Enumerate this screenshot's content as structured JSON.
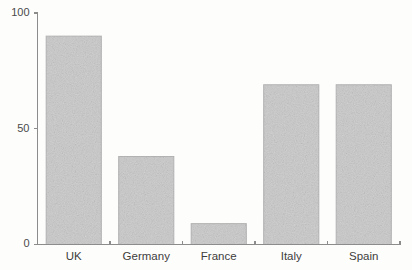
{
  "chart_data": {
    "type": "bar",
    "title": "",
    "subtitle": "",
    "xlabel": "",
    "ylabel": "",
    "categories": [
      "UK",
      "Germany",
      "France",
      "Italy",
      "Spain"
    ],
    "values": [
      90,
      38,
      9,
      69,
      69
    ],
    "ylim": [
      0,
      100
    ],
    "yticks": [
      0,
      50,
      100
    ],
    "ytick_labels": [
      "0",
      "50",
      "100"
    ],
    "grid": false,
    "legend": false,
    "legend_position": "none",
    "bar_color": "#c9c9c9",
    "bar_edge_color": "#b0b0b0",
    "axis_color": "#8c8c8c",
    "background_color": "#fdfdfc",
    "series": [
      {
        "name": "",
        "values": [
          90,
          38,
          9,
          69,
          69
        ]
      }
    ]
  },
  "axes": {
    "y_axis_name": "y-axis",
    "x_axis_name": "x-axis"
  }
}
